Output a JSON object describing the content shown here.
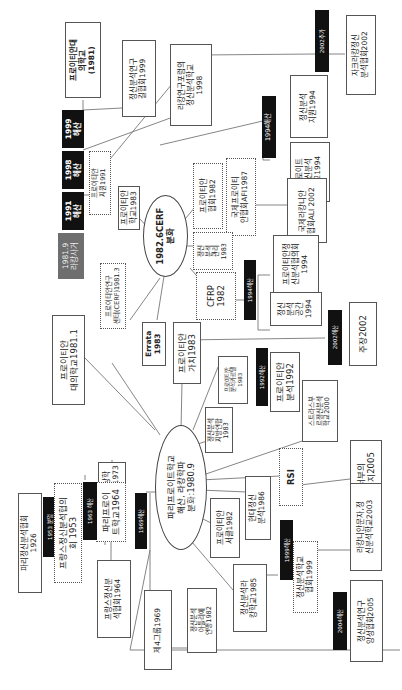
{
  "diagram": {
    "orientation": "rotated-90-ccw",
    "center_nodes": {
      "paris_freudian_school": "파리프로이트학교\n해산, 라캉학파\n분화:1980.9",
      "cerf_split": "1982.6CERF\n분화"
    },
    "timeline_markers": {
      "lacan_death": "1981.9\n라캉사거",
      "dissolve_1991": "1991\n해산",
      "dissolve_1998": "1998\n해산",
      "dissolve_1999": "1999\n해산",
      "dissolve_1953": "1953 분열",
      "dissolve_1963": "1963 해산",
      "dissolve_1969": "1969해산",
      "dissolve_1994_top": "1994해산",
      "dissolve_1994_mid": "1994해산",
      "dissolve_1992": "1992해산",
      "dissolve_2002_mid": "2002해산",
      "later_2002": "2002추가",
      "dissolve_1999_bottom": "1999해산",
      "dissolve_2004": "2004해산"
    },
    "nodes": {
      "freudian_univ_school_1981": "프로이티안대\n의학교\n(1981)",
      "psa_research_assoc_1999": "정신분석연구\n길협회1999",
      "lacan_forum_school_1998": "라캉연구포럼의\n정신분석학교\n1998",
      "zurich_lacan_2002": "자크라캉정신\n분석협회2002",
      "freudian_support_1991": "프로이티안\n지원1991",
      "psa_support_1994": "정신분석\n지원1994",
      "freud_psa_school_1994": "프로이트\n정신분석\n학교1994",
      "freudian_school_1983": "프로이티안\n학교1983",
      "freudian_assoc_1982": "프로이티안\n협회1982",
      "intl_freudian_afi_1987": "국제프로이티\n안협회AFI1987",
      "intl_lacanian_ali_2002": "국제라캉니안\n협회ALI 2002",
      "psa_management_1983": "정신\n분석\n관리\n1983",
      "freudian_psa_assoc_1994": "프로이티안정\n신분석협의회\n1994",
      "cfrp_1982": "CFRP\n1982",
      "psa_space_1994": "정신\n분석\n공간\n1994",
      "freudian_research_center_1981": "프로이티안연구\n센터(CERF)1981.3",
      "freudian_univ_school_1981_1": "프로이티안\n대의학교1981.1",
      "errata_1983": "Errata\n1983",
      "freudian_value_1983": "프로이티안\n가치1983",
      "assertion_2002": "주장2002",
      "freudian_analysis_cartel_1983": "프로이티안\n분석카르텔\n1983",
      "freudian_analysis_1992": "프로이티안\n분석1992",
      "psa_local_union_1983": "정신분석\n지방연합\n1983",
      "strasbourg_school_2000": "스트라스부\n르정신분석\n학교2000",
      "topology_1973": "위상학\n전파1973",
      "paris_freud_school_1964": "파리프로이\n트학교1964",
      "rsi": "RSI",
      "west_cauce_2005": "서부의\n카우지2005",
      "paris_psa_society_1926": "파리정신분석협회\n1926",
      "french_psa_assoc_1953": "프랑스정신분석협의\n회 1953",
      "french_psa_society_1964": "프랑스정신분\n석협회1964",
      "modern_psa_1986": "현대정신\n분석1986",
      "freudian_seoul_1982": "프로이티안\n서클1982",
      "lacanian_letter_2003": "라캉니안문자,정\n신분석학교2003",
      "fourth_group_1969": "제4그룹1969",
      "psa_arab_union_1982": "정신분석\n아틀리에\n연맹1982",
      "psa_lacan_school_1985": "정신분석라\n캉학교1985",
      "psa_school_assoc_1999": "정신분석학교\n협회1999",
      "psa_research_training_2005": "정신분석연구\n양성협회2005"
    }
  }
}
